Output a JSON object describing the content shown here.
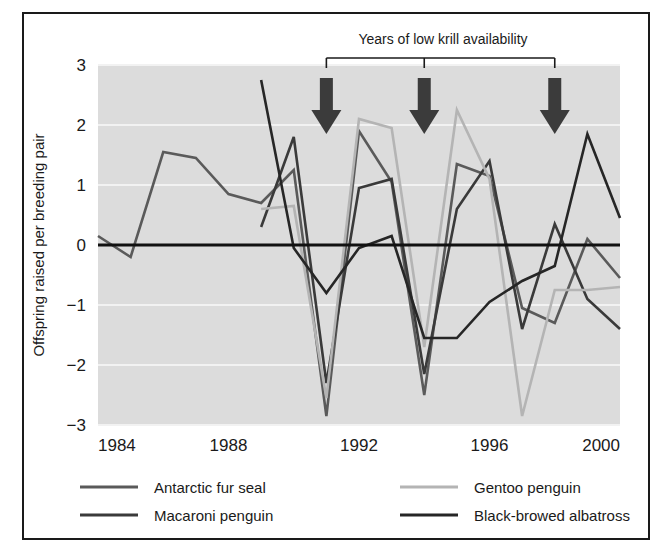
{
  "chart_data": {
    "type": "line",
    "title": "",
    "xlabel": "",
    "ylabel": "Offspring raised per breeding pair",
    "xlim": [
      1984,
      2000
    ],
    "ylim": [
      -3,
      3
    ],
    "xticks": [
      "1984",
      "1988",
      "1992",
      "1996",
      "2000"
    ],
    "yticks": [
      "3",
      "2",
      "1",
      "0",
      "−1",
      "−2",
      "−3"
    ],
    "grid": true,
    "legend_position": "bottom",
    "x": [
      1984,
      1985,
      1986,
      1987,
      1988,
      1989,
      1990,
      1991,
      1992,
      1993,
      1994,
      1995,
      1996,
      1997,
      1998,
      1999,
      2000
    ],
    "series": [
      {
        "name": "Antarctic fur seal",
        "color": "#5a5a5a",
        "values": [
          0.15,
          -0.2,
          1.55,
          1.45,
          0.85,
          0.7,
          1.25,
          -2.85,
          1.9,
          1.05,
          -2.5,
          1.35,
          1.15,
          -1.05,
          -1.3,
          0.1,
          -0.55
        ]
      },
      {
        "name": "Macaroni penguin",
        "color": "#3a3a3a",
        "values": [
          null,
          null,
          null,
          null,
          null,
          0.3,
          1.8,
          -2.3,
          0.95,
          1.1,
          -2.15,
          0.6,
          1.4,
          -1.4,
          0.35,
          -0.9,
          -1.4
        ]
      },
      {
        "name": "Gentoo penguin",
        "color": "#b4b4b4",
        "values": [
          null,
          null,
          null,
          null,
          null,
          0.6,
          0.65,
          -2.55,
          2.1,
          1.95,
          -1.7,
          2.25,
          1.1,
          -2.85,
          -0.75,
          -0.75,
          -0.7
        ]
      },
      {
        "name": "Black-browed albatross",
        "color": "#262626",
        "values": [
          null,
          null,
          null,
          null,
          null,
          2.75,
          -0.05,
          -0.8,
          -0.05,
          0.15,
          -1.55,
          -1.55,
          -0.95,
          -0.6,
          -0.35,
          1.85,
          0.45
        ]
      }
    ],
    "annotations": {
      "bracket_label": "Years of low krill availability",
      "bracket_span_years": [
        1991,
        1998
      ],
      "bracket_tick_years": [
        1991,
        1994,
        1998
      ],
      "arrow_years": [
        1991,
        1994,
        1998
      ],
      "arrow_color": "#3b3b3b",
      "zero_line": 0,
      "zero_line_color": "#111111"
    },
    "style": {
      "plot_background": "#dcdcdc",
      "gridline_color": "#f2f2f2",
      "frame_color": "#1a1a1a"
    }
  },
  "legend": {
    "items": [
      {
        "label": "Antarctic fur seal",
        "color": "#5a5a5a"
      },
      {
        "label": "Gentoo penguin",
        "color": "#b4b4b4"
      },
      {
        "label": "Macaroni penguin",
        "color": "#3a3a3a"
      },
      {
        "label": "Black-browed albatross",
        "color": "#262626"
      }
    ]
  }
}
